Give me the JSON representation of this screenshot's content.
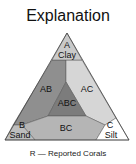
{
  "title": "Explanation",
  "regions": {
    "a": {
      "code": "A",
      "name": "Clay",
      "color": "#c9c9c9"
    },
    "b": {
      "code": "B",
      "name": "Sand",
      "color": "#bdbdbd"
    },
    "c": {
      "code": "C",
      "name": "Silt",
      "color": "#ffffff"
    },
    "ab": {
      "code": "AB",
      "color": "#8f8f8f"
    },
    "ac": {
      "code": "AC",
      "color": "#d6d6d6"
    },
    "abc": {
      "code": "ABC",
      "color": "#7c7c7c"
    },
    "bc": {
      "code": "BC",
      "color": "#b5b5b5"
    }
  },
  "caption": "R — Reported Corals"
}
